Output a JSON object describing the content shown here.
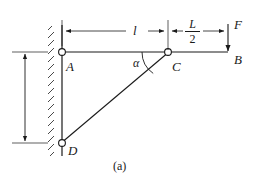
{
  "figure": {
    "caption": "(a)",
    "type": "statics-bracket-free-body-diagram",
    "stroke_color": "#1a1a1a",
    "background": "#ffffff"
  },
  "labels": {
    "joint_a": "A",
    "joint_c": "C",
    "joint_d": "D",
    "end_b": "B",
    "force_f": "F",
    "angle_alpha": "α",
    "dim_horizontal_l": "l",
    "dim_horizontal_half_L_numerator": "L",
    "dim_horizontal_half_L_denominator": "2"
  },
  "geometry": {
    "wall_x": 62,
    "wall_top_y": 25,
    "wall_bottom_y": 156,
    "hatch_width": 14,
    "beam_y": 52,
    "beam_left_x": 62,
    "beam_right_x": 228,
    "joint_a": {
      "x": 62,
      "y": 52
    },
    "joint_c": {
      "x": 168,
      "y": 52
    },
    "joint_d": {
      "x": 62,
      "y": 143
    },
    "end_b": {
      "x": 228,
      "y": 52
    },
    "pin_radius": 3.4,
    "dim_line_y": 31,
    "force_arrow_x": 228,
    "force_arrow_top_y": 24,
    "vertical_dim_x": 25,
    "vertical_dim_top_y": 52,
    "vertical_dim_bottom_y": 143,
    "angle_arc_radius": 26
  },
  "dimensions": {
    "segment_a_to_c": "l",
    "segment_c_to_b": "L/2"
  }
}
